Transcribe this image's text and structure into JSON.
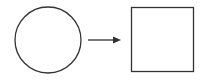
{
  "diagram": {
    "nodes": [
      {
        "id": "circle",
        "shape": "circle",
        "label": ""
      },
      {
        "id": "square",
        "shape": "square",
        "label": ""
      }
    ],
    "edges": [
      {
        "from": "circle",
        "to": "square",
        "type": "arrow",
        "label": ""
      }
    ],
    "colors": {
      "stroke": "#333333",
      "background": "#ffffff"
    }
  }
}
